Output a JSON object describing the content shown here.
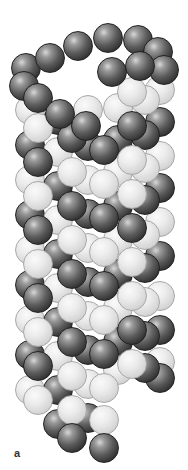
{
  "figure": {
    "panel_label": "a",
    "colors": {
      "dark": "#3a3a3a",
      "light": "#dcdcdc",
      "background": "#ffffff"
    },
    "sphere_diameter": 30,
    "spheres": [
      {
        "x": 160,
        "y": 296,
        "s": "light"
      },
      {
        "x": 160,
        "y": 330,
        "s": "dark"
      },
      {
        "x": 160,
        "y": 362,
        "s": "light"
      },
      {
        "x": 160,
        "y": 378,
        "s": "dark"
      },
      {
        "x": 160,
        "y": 90,
        "s": "light"
      },
      {
        "x": 160,
        "y": 122,
        "s": "dark"
      },
      {
        "x": 160,
        "y": 156,
        "s": "light"
      },
      {
        "x": 160,
        "y": 188,
        "s": "dark"
      },
      {
        "x": 160,
        "y": 222,
        "s": "light"
      },
      {
        "x": 160,
        "y": 256,
        "s": "dark"
      },
      {
        "x": 30,
        "y": 110,
        "s": "light"
      },
      {
        "x": 30,
        "y": 145,
        "s": "dark"
      },
      {
        "x": 30,
        "y": 180,
        "s": "light"
      },
      {
        "x": 30,
        "y": 215,
        "s": "dark"
      },
      {
        "x": 30,
        "y": 250,
        "s": "light"
      },
      {
        "x": 30,
        "y": 285,
        "s": "dark"
      },
      {
        "x": 30,
        "y": 320,
        "s": "light"
      },
      {
        "x": 30,
        "y": 355,
        "s": "dark"
      },
      {
        "x": 30,
        "y": 390,
        "s": "light"
      },
      {
        "x": 145,
        "y": 100,
        "s": "light"
      },
      {
        "x": 145,
        "y": 135,
        "s": "dark"
      },
      {
        "x": 145,
        "y": 168,
        "s": "light"
      },
      {
        "x": 145,
        "y": 200,
        "s": "dark"
      },
      {
        "x": 145,
        "y": 235,
        "s": "light"
      },
      {
        "x": 145,
        "y": 268,
        "s": "dark"
      },
      {
        "x": 145,
        "y": 302,
        "s": "light"
      },
      {
        "x": 145,
        "y": 336,
        "s": "dark"
      },
      {
        "x": 145,
        "y": 368,
        "s": "dark"
      },
      {
        "x": 118,
        "y": 108,
        "s": "light"
      },
      {
        "x": 118,
        "y": 140,
        "s": "dark"
      },
      {
        "x": 118,
        "y": 172,
        "s": "light"
      },
      {
        "x": 118,
        "y": 206,
        "s": "dark"
      },
      {
        "x": 118,
        "y": 240,
        "s": "light"
      },
      {
        "x": 118,
        "y": 274,
        "s": "dark"
      },
      {
        "x": 118,
        "y": 308,
        "s": "light"
      },
      {
        "x": 118,
        "y": 342,
        "s": "dark"
      },
      {
        "x": 118,
        "y": 370,
        "s": "light"
      },
      {
        "x": 88,
        "y": 110,
        "s": "light"
      },
      {
        "x": 88,
        "y": 146,
        "s": "dark"
      },
      {
        "x": 88,
        "y": 180,
        "s": "light"
      },
      {
        "x": 88,
        "y": 214,
        "s": "dark"
      },
      {
        "x": 88,
        "y": 248,
        "s": "light"
      },
      {
        "x": 88,
        "y": 282,
        "s": "dark"
      },
      {
        "x": 88,
        "y": 316,
        "s": "light"
      },
      {
        "x": 88,
        "y": 350,
        "s": "dark"
      },
      {
        "x": 88,
        "y": 384,
        "s": "light"
      },
      {
        "x": 88,
        "y": 418,
        "s": "dark"
      },
      {
        "x": 58,
        "y": 120,
        "s": "dark"
      },
      {
        "x": 58,
        "y": 152,
        "s": "light"
      },
      {
        "x": 58,
        "y": 186,
        "s": "dark"
      },
      {
        "x": 58,
        "y": 220,
        "s": "light"
      },
      {
        "x": 58,
        "y": 254,
        "s": "dark"
      },
      {
        "x": 58,
        "y": 288,
        "s": "light"
      },
      {
        "x": 58,
        "y": 322,
        "s": "dark"
      },
      {
        "x": 58,
        "y": 356,
        "s": "light"
      },
      {
        "x": 58,
        "y": 390,
        "s": "dark"
      },
      {
        "x": 58,
        "y": 424,
        "s": "dark"
      },
      {
        "x": 38,
        "y": 128,
        "s": "light"
      },
      {
        "x": 38,
        "y": 162,
        "s": "dark"
      },
      {
        "x": 38,
        "y": 196,
        "s": "light"
      },
      {
        "x": 38,
        "y": 230,
        "s": "dark"
      },
      {
        "x": 38,
        "y": 264,
        "s": "light"
      },
      {
        "x": 38,
        "y": 298,
        "s": "dark"
      },
      {
        "x": 38,
        "y": 332,
        "s": "light"
      },
      {
        "x": 38,
        "y": 366,
        "s": "dark"
      },
      {
        "x": 38,
        "y": 400,
        "s": "light"
      },
      {
        "x": 72,
        "y": 138,
        "s": "dark"
      },
      {
        "x": 72,
        "y": 172,
        "s": "light"
      },
      {
        "x": 72,
        "y": 206,
        "s": "dark"
      },
      {
        "x": 72,
        "y": 240,
        "s": "light"
      },
      {
        "x": 72,
        "y": 274,
        "s": "dark"
      },
      {
        "x": 72,
        "y": 308,
        "s": "light"
      },
      {
        "x": 72,
        "y": 342,
        "s": "dark"
      },
      {
        "x": 72,
        "y": 376,
        "s": "light"
      },
      {
        "x": 72,
        "y": 410,
        "s": "light"
      },
      {
        "x": 72,
        "y": 438,
        "s": "dark"
      },
      {
        "x": 104,
        "y": 150,
        "s": "dark"
      },
      {
        "x": 104,
        "y": 184,
        "s": "light"
      },
      {
        "x": 104,
        "y": 218,
        "s": "dark"
      },
      {
        "x": 104,
        "y": 252,
        "s": "light"
      },
      {
        "x": 104,
        "y": 286,
        "s": "dark"
      },
      {
        "x": 104,
        "y": 320,
        "s": "light"
      },
      {
        "x": 104,
        "y": 354,
        "s": "dark"
      },
      {
        "x": 104,
        "y": 388,
        "s": "light"
      },
      {
        "x": 104,
        "y": 420,
        "s": "light"
      },
      {
        "x": 104,
        "y": 448,
        "s": "dark"
      },
      {
        "x": 132,
        "y": 92,
        "s": "light"
      },
      {
        "x": 132,
        "y": 126,
        "s": "dark"
      },
      {
        "x": 132,
        "y": 160,
        "s": "light"
      },
      {
        "x": 132,
        "y": 194,
        "s": "light"
      },
      {
        "x": 132,
        "y": 228,
        "s": "dark"
      },
      {
        "x": 132,
        "y": 262,
        "s": "light"
      },
      {
        "x": 132,
        "y": 296,
        "s": "light"
      },
      {
        "x": 132,
        "y": 330,
        "s": "dark"
      },
      {
        "x": 132,
        "y": 364,
        "s": "light"
      },
      {
        "x": 26,
        "y": 68,
        "s": "dark"
      },
      {
        "x": 50,
        "y": 58,
        "s": "dark"
      },
      {
        "x": 78,
        "y": 46,
        "s": "dark"
      },
      {
        "x": 108,
        "y": 38,
        "s": "dark"
      },
      {
        "x": 138,
        "y": 40,
        "s": "dark"
      },
      {
        "x": 158,
        "y": 52,
        "s": "dark"
      },
      {
        "x": 164,
        "y": 70,
        "s": "dark"
      },
      {
        "x": 24,
        "y": 86,
        "s": "dark"
      },
      {
        "x": 38,
        "y": 98,
        "s": "dark"
      },
      {
        "x": 60,
        "y": 114,
        "s": "dark"
      },
      {
        "x": 86,
        "y": 126,
        "s": "dark"
      },
      {
        "x": 112,
        "y": 72,
        "s": "dark"
      },
      {
        "x": 140,
        "y": 66,
        "s": "dark"
      }
    ]
  }
}
